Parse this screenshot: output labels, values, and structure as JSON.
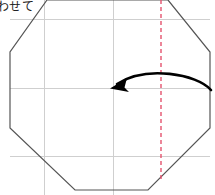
{
  "figure": {
    "caption": "わせて",
    "width": 215,
    "height": 195,
    "background_color": "#ffffff",
    "outline_color": "#555555",
    "grid_color": "#cfcfcf",
    "fold_line_color": "#e4536e",
    "arrow_color": "#000000",
    "shape_name": "octagon",
    "outline_points": "47,0 10,52 10,128 75,190 148,190 210,128 210,52 168,0",
    "grid": {
      "horizontal_lines": [
        {
          "name": "grid-line-top",
          "y": 19,
          "x1": 10,
          "x2": 210
        },
        {
          "name": "grid-line-middle",
          "y": 88,
          "x1": 10,
          "x2": 210
        },
        {
          "name": "grid-line-bottom",
          "y": 156,
          "x1": 10,
          "x2": 210
        }
      ],
      "vertical_lines": [
        {
          "name": "grid-line-left",
          "x": 44,
          "y1": 0,
          "y2": 195
        },
        {
          "name": "grid-line-center",
          "x": 113,
          "y1": 0,
          "y2": 195
        },
        {
          "name": "grid-line-right",
          "x": 113,
          "y1": 0,
          "y2": 195
        }
      ]
    },
    "fold_line": {
      "name": "vertical-fold-line",
      "x": 161,
      "y1": 0,
      "y2": 180,
      "style": "dashed"
    },
    "arrow": {
      "name": "fold-direction-arrow",
      "path": "M 211 90 C 196 74 144 66 114 87",
      "direction": "right-to-left",
      "head_x": 112,
      "head_y": 87
    }
  }
}
